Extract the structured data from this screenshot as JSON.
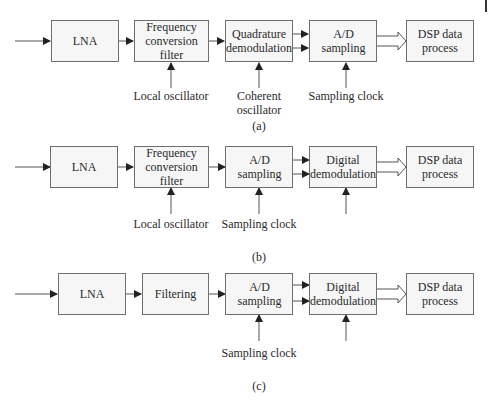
{
  "diagrams": [
    {
      "caption": "(a)",
      "blocks": [
        "LNA",
        "Frequency conversion filter",
        "Quadrature demodulation",
        "A/D sampling",
        "DSP data process"
      ],
      "inputs": [
        "Local oscillator",
        "Coherent oscillator",
        "Sampling clock"
      ]
    },
    {
      "caption": "(b)",
      "blocks": [
        "LNA",
        "Frequency conversion filter",
        "A/D sampling",
        "Digital demodulation",
        "DSP data process"
      ],
      "inputs": [
        "Local oscillator",
        "Sampling clock"
      ]
    },
    {
      "caption": "(c)",
      "blocks": [
        "LNA",
        "Filtering",
        "A/D sampling",
        "Digital demodulation",
        "DSP data process"
      ],
      "inputs": [
        "Sampling clock"
      ]
    }
  ],
  "colors": {
    "box_border": "#6e6e6e",
    "box_fill": "#f6f6f6",
    "arrow": "#222222"
  }
}
